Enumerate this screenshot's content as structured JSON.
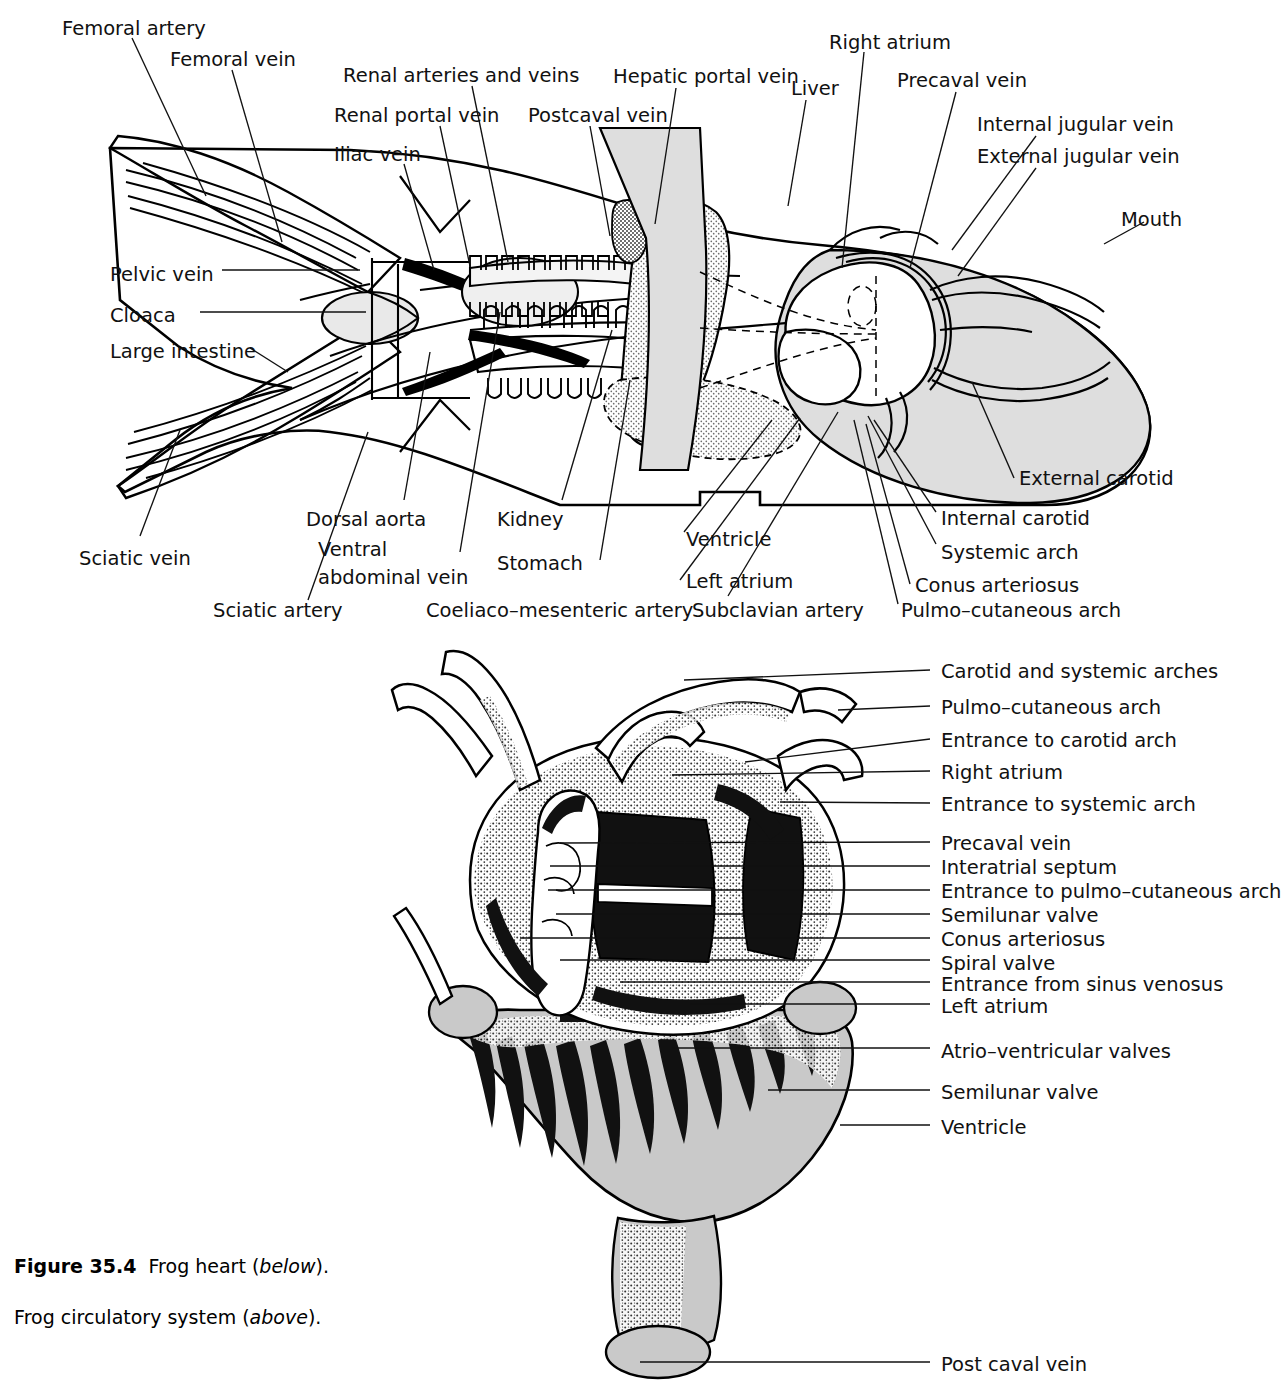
{
  "figure": {
    "caption_number": "Figure 35.4",
    "caption_line1_a": "Frog heart (",
    "caption_line1_it": "below",
    "caption_line1_b": ").",
    "caption_line2_a": "Frog circulatory system (",
    "caption_line2_it": "above",
    "caption_line2_b": ")."
  },
  "colors": {
    "body_fill": "#c9c9c9",
    "organ_light": "#e4e4e4",
    "stipple": "#d2d2d2",
    "ink": "#111111",
    "white": "#ffffff"
  },
  "upper_figure": {
    "title": "Frog circulatory system",
    "labels": [
      {
        "id": "femoral-artery",
        "text": "Femoral artery",
        "x": 62,
        "y": 18,
        "align": "left"
      },
      {
        "id": "femoral-vein",
        "text": "Femoral vein",
        "x": 170,
        "y": 49,
        "align": "left"
      },
      {
        "id": "renal-arteries-and-veins",
        "text": "Renal arteries and veins",
        "x": 343,
        "y": 65,
        "align": "left"
      },
      {
        "id": "renal-portal-vein",
        "text": "Renal portal vein",
        "x": 334,
        "y": 105,
        "align": "left"
      },
      {
        "id": "postcaval-vein",
        "text": "Postcaval vein",
        "x": 528,
        "y": 105,
        "align": "left"
      },
      {
        "id": "hepatic-portal-vein",
        "text": "Hepatic portal vein",
        "x": 613,
        "y": 66,
        "align": "left"
      },
      {
        "id": "liver",
        "text": "Liver",
        "x": 791,
        "y": 78,
        "align": "left"
      },
      {
        "id": "right-atrium",
        "text": "Right atrium",
        "x": 829,
        "y": 32,
        "align": "left"
      },
      {
        "id": "precaval-vein",
        "text": "Precaval vein",
        "x": 897,
        "y": 70,
        "align": "left"
      },
      {
        "id": "internal-jugular-vein",
        "text": "Internal jugular vein",
        "x": 977,
        "y": 114,
        "align": "left"
      },
      {
        "id": "external-jugular-vein",
        "text": "External jugular vein",
        "x": 977,
        "y": 146,
        "align": "left"
      },
      {
        "id": "iliac-vein",
        "text": "Iliac vein",
        "x": 334,
        "y": 144,
        "align": "left"
      },
      {
        "id": "mouth",
        "text": "Mouth",
        "x": 1121,
        "y": 209,
        "align": "left"
      },
      {
        "id": "pelvic-vein",
        "text": "Pelvic vein",
        "x": 110,
        "y": 264,
        "align": "left"
      },
      {
        "id": "cloaca",
        "text": "Cloaca",
        "x": 110,
        "y": 305,
        "align": "left"
      },
      {
        "id": "large-intestine",
        "text": "Large intestine",
        "x": 110,
        "y": 341,
        "align": "left"
      },
      {
        "id": "external-carotid",
        "text": "External carotid",
        "x": 1019,
        "y": 468,
        "align": "left"
      },
      {
        "id": "internal-carotid",
        "text": "Internal carotid",
        "x": 941,
        "y": 508,
        "align": "left"
      },
      {
        "id": "dorsal-aorta",
        "text": "Dorsal aorta",
        "x": 306,
        "y": 509,
        "align": "left"
      },
      {
        "id": "kidney",
        "text": "Kidney",
        "x": 497,
        "y": 509,
        "align": "left"
      },
      {
        "id": "ventricle",
        "text": "Ventricle",
        "x": 686,
        "y": 529,
        "align": "left"
      },
      {
        "id": "systemic-arch",
        "text": "Systemic arch",
        "x": 941,
        "y": 542,
        "align": "left"
      },
      {
        "id": "sciatic-vein",
        "text": "Sciatic vein",
        "x": 79,
        "y": 548,
        "align": "left"
      },
      {
        "id": "ventral-abdominal-vein-1",
        "text": "Ventral",
        "x": 318,
        "y": 539,
        "align": "left"
      },
      {
        "id": "ventral-abdominal-vein-2",
        "text": "abdominal vein",
        "x": 318,
        "y": 567,
        "align": "left"
      },
      {
        "id": "stomach",
        "text": "Stomach",
        "x": 497,
        "y": 553,
        "align": "left"
      },
      {
        "id": "left-atrium",
        "text": "Left atrium",
        "x": 686,
        "y": 571,
        "align": "left"
      },
      {
        "id": "conus-arteriosus",
        "text": "Conus arteriosus",
        "x": 915,
        "y": 575,
        "align": "left"
      },
      {
        "id": "sciatic-artery",
        "text": "Sciatic artery",
        "x": 213,
        "y": 600,
        "align": "left"
      },
      {
        "id": "coeliaco-mesenteric-artery",
        "text": "Coeliaco–mesenteric artery",
        "x": 426,
        "y": 600,
        "align": "left"
      },
      {
        "id": "subclavian-artery",
        "text": "Subclavian artery",
        "x": 692,
        "y": 600,
        "align": "left"
      },
      {
        "id": "pulmo-cutaneous-arch",
        "text": "Pulmo–cutaneous arch",
        "x": 901,
        "y": 600,
        "align": "left"
      }
    ]
  },
  "lower_figure": {
    "title": "Frog heart",
    "labels": [
      {
        "id": "carotid-and-systemic-arches",
        "text": "Carotid and systemic arches",
        "x": 941,
        "y": 661
      },
      {
        "id": "pulmo-cutaneous-arch",
        "text": "Pulmo–cutaneous arch",
        "x": 941,
        "y": 697
      },
      {
        "id": "entrance-to-carotid-arch",
        "text": "Entrance to carotid arch",
        "x": 941,
        "y": 730
      },
      {
        "id": "right-atrium",
        "text": "Right atrium",
        "x": 941,
        "y": 762
      },
      {
        "id": "entrance-to-systemic-arch",
        "text": "Entrance to systemic arch",
        "x": 941,
        "y": 794
      },
      {
        "id": "precaval-vein",
        "text": "Precaval vein",
        "x": 941,
        "y": 833
      },
      {
        "id": "interatrial-septum",
        "text": "Interatrial septum",
        "x": 941,
        "y": 857
      },
      {
        "id": "entrance-to-pulmo-cutaneous-arch",
        "text": "Entrance to pulmo–cutaneous arch",
        "x": 941,
        "y": 881
      },
      {
        "id": "semilunar-valve-upper",
        "text": "Semilunar valve",
        "x": 941,
        "y": 905
      },
      {
        "id": "conus-arteriosus",
        "text": "Conus arteriosus",
        "x": 941,
        "y": 929
      },
      {
        "id": "spiral-valve",
        "text": "Spiral valve",
        "x": 941,
        "y": 953
      },
      {
        "id": "entrance-from-sinus-venosus",
        "text": "Entrance from sinus venosus",
        "x": 941,
        "y": 974
      },
      {
        "id": "left-atrium",
        "text": "Left atrium",
        "x": 941,
        "y": 996
      },
      {
        "id": "atrio-ventricular-valves",
        "text": "Atrio–ventricular valves",
        "x": 941,
        "y": 1041
      },
      {
        "id": "semilunar-valve-lower",
        "text": "Semilunar valve",
        "x": 941,
        "y": 1082
      },
      {
        "id": "ventricle",
        "text": "Ventricle",
        "x": 941,
        "y": 1117
      },
      {
        "id": "post-caval-vein",
        "text": "Post caval vein",
        "x": 941,
        "y": 1354
      }
    ]
  }
}
